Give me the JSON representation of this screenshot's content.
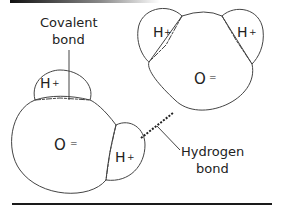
{
  "diagram": {
    "labels": {
      "covalent_line1": "Covalent",
      "covalent_line2": "bond",
      "hydrogen_line1": "Hydrogen",
      "hydrogen_line2": "bond"
    },
    "molecule_left": {
      "oxygen": "O",
      "oxygen_charge": "=",
      "hydrogen_top": "H",
      "hydrogen_top_charge": "+",
      "hydrogen_right": "H",
      "hydrogen_right_charge": "+"
    },
    "molecule_right": {
      "oxygen": "O",
      "oxygen_charge": "=",
      "hydrogen_left": "H",
      "hydrogen_left_charge": "+",
      "hydrogen_right": "H",
      "hydrogen_right_charge": "+"
    },
    "colors": {
      "stroke": "#444444",
      "text": "#222222",
      "rule": "#1a1a1a"
    }
  }
}
